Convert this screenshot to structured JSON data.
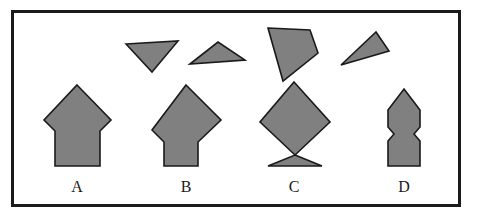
{
  "figure": {
    "background_color": "#ffffff",
    "frame": {
      "name": "outer-border",
      "stroke_color": "#1a1a1a",
      "stroke_width": 3,
      "x": 11,
      "y": 10,
      "width": 450,
      "height": 197
    },
    "style": {
      "shape_fill": "#808080",
      "shape_stroke": "#1a1a1a",
      "shape_stroke_width": 1.6,
      "label_color": "#1a1a1a",
      "label_font_size": 16
    }
  },
  "pieces": {
    "caption": "Loose polygon pieces (top row)",
    "items": [
      {
        "id": "piece-1",
        "name": "piece-triangle-down-left",
        "kind": "triangle",
        "points": "126,44 178,41 152,72",
        "fill": "#808080"
      },
      {
        "id": "piece-2",
        "name": "piece-triangle-flat-wide",
        "kind": "triangle",
        "points": "190,64 218,42 245,60",
        "fill": "#808080"
      },
      {
        "id": "piece-3",
        "name": "piece-quadrilateral-kite",
        "kind": "quadrilateral",
        "points": "268,28 310,30 318,53 283,81",
        "fill": "#808080"
      },
      {
        "id": "piece-4",
        "name": "piece-triangle-thin-slanted",
        "kind": "triangle",
        "points": "376,32 389,51 341,65",
        "fill": "#808080"
      }
    ]
  },
  "answers": {
    "caption": "Answer choices (bottom row)",
    "items": [
      {
        "id": "choice-a",
        "label": "A",
        "name": "answer-shape-a",
        "description": "Diamond head with notched shoulders over a wide rectangular stem",
        "points": "77,85 111,120 100,131 100,166 55,166 55,131 44,120",
        "label_x": 77,
        "label_y": 192,
        "fill": "#808080"
      },
      {
        "id": "choice-b",
        "label": "B",
        "name": "answer-shape-b",
        "description": "Diamond head with sloped shoulders over a narrow rectangular stem",
        "points": "186,85 221,120 198,142 198,166 164,166 164,142 152,130",
        "label_x": 186,
        "label_y": 192,
        "fill": "#808080"
      },
      {
        "id": "choice-c",
        "label": "C",
        "name": "answer-shape-c",
        "description": "Diamond above a downward triangle meeting at a single point (bowtie join)",
        "points": "294,82 330,122 295,155 260,122",
        "points2": "295,155 322,166 268,166",
        "label_x": 294,
        "label_y": 192,
        "fill": "#808080"
      },
      {
        "id": "choice-d",
        "label": "D",
        "name": "answer-shape-d",
        "description": "Narrow pointed-top column with concave notches on both sides",
        "points": "404,89 420,110 420,127 414,134 420,141 420,166 388,166 388,141 394,134 388,127 388,110",
        "label_x": 404,
        "label_y": 192,
        "fill": "#808080"
      }
    ]
  }
}
